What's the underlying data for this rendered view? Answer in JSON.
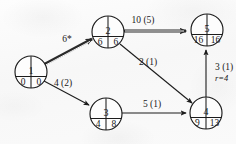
{
  "diagram": {
    "type": "activity-on-arc-network",
    "nodes": [
      {
        "id": "n1",
        "label": "1",
        "left": "0",
        "right": "0",
        "cx": 31,
        "cy": 72,
        "r": 16
      },
      {
        "id": "n2",
        "label": "2",
        "left": "6",
        "right": "6",
        "cx": 108,
        "cy": 32,
        "r": 16
      },
      {
        "id": "n3",
        "label": "3",
        "left": "4",
        "right": "8",
        "cx": 106,
        "cy": 114,
        "r": 16
      },
      {
        "id": "n4",
        "label": "4",
        "left": "9",
        "right": "13",
        "cx": 206,
        "cy": 113,
        "r": 16
      },
      {
        "id": "n5",
        "label": "5",
        "left": "16",
        "right": "16",
        "cx": 207,
        "cy": 30,
        "r": 16
      }
    ],
    "edges": [
      {
        "id": "e12",
        "from": "1",
        "to": "2",
        "label": "6*",
        "sub": "",
        "style": "double",
        "lx": 67,
        "ly": 42
      },
      {
        "id": "e13",
        "from": "1",
        "to": "3",
        "label": "4 (2)",
        "sub": "",
        "style": "single",
        "lx": 63,
        "ly": 86
      },
      {
        "id": "e25",
        "from": "2",
        "to": "5",
        "label": "10 (5)",
        "sub": "",
        "style": "double",
        "lx": 143,
        "ly": 23
      },
      {
        "id": "e24",
        "from": "2",
        "to": "4",
        "label": "2 (1)",
        "sub": "",
        "style": "single",
        "lx": 148,
        "ly": 65
      },
      {
        "id": "e34",
        "from": "3",
        "to": "4",
        "label": "5 (1)",
        "sub": "",
        "style": "single",
        "lx": 152,
        "ly": 107
      },
      {
        "id": "e45",
        "from": "4",
        "to": "5",
        "label": "3 (1)",
        "sub": "r=4",
        "style": "single",
        "lx": 215,
        "ly": 70
      }
    ]
  }
}
